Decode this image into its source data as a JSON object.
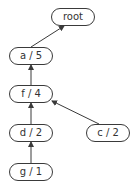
{
  "diagram": {
    "type": "tree",
    "direction": "child-to-parent",
    "colors": {
      "stroke": "#3a3a3a",
      "text": "#333333",
      "background": "#ffffff"
    },
    "nodes": [
      {
        "id": "root",
        "label": "root",
        "x": 51,
        "y": 8
      },
      {
        "id": "a",
        "label": "a / 5",
        "x": 9,
        "y": 47
      },
      {
        "id": "f",
        "label": "f / 4",
        "x": 9,
        "y": 85
      },
      {
        "id": "d",
        "label": "d / 2",
        "x": 9,
        "y": 124
      },
      {
        "id": "c",
        "label": "c / 2",
        "x": 86,
        "y": 124
      },
      {
        "id": "g",
        "label": "g / 1",
        "x": 9,
        "y": 163
      }
    ],
    "edges": [
      {
        "from": "a",
        "to": "root"
      },
      {
        "from": "f",
        "to": "a"
      },
      {
        "from": "d",
        "to": "f"
      },
      {
        "from": "c",
        "to": "f"
      },
      {
        "from": "g",
        "to": "d"
      }
    ]
  }
}
